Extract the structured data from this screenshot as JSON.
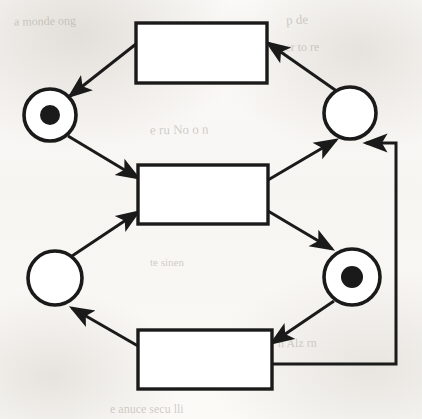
{
  "diagram": {
    "type": "petri-net",
    "canvas": {
      "width": 422,
      "height": 419
    },
    "colors": {
      "stroke": "#1a1a1a",
      "fill": "#ffffff",
      "token": "#1a1a1a",
      "page": "#fbfaf8"
    },
    "places": [
      {
        "id": "p1",
        "name": "place-top-left",
        "cx": 50,
        "cy": 115,
        "r": 26,
        "tokens": 1,
        "token_radius": 10,
        "label": ""
      },
      {
        "id": "p2",
        "name": "place-top-right",
        "cx": 350,
        "cy": 113,
        "r": 26,
        "tokens": 0,
        "token_radius": 10,
        "label": ""
      },
      {
        "id": "p3",
        "name": "place-bottom-left",
        "cx": 55,
        "cy": 278,
        "r": 27,
        "tokens": 0,
        "token_radius": 10,
        "label": ""
      },
      {
        "id": "p4",
        "name": "place-bottom-right",
        "cx": 352,
        "cy": 277,
        "r": 28,
        "tokens": 1,
        "token_radius": 11,
        "label": ""
      }
    ],
    "transitions": [
      {
        "id": "t1",
        "name": "transition-top",
        "x": 136,
        "y": 23,
        "w": 131,
        "h": 60,
        "label": ""
      },
      {
        "id": "t2",
        "name": "transition-middle",
        "x": 138,
        "y": 165,
        "w": 130,
        "h": 59,
        "label": ""
      },
      {
        "id": "t3",
        "name": "transition-bottom",
        "x": 138,
        "y": 330,
        "w": 134,
        "h": 59,
        "label": ""
      }
    ],
    "arcs": [
      {
        "id": "a1",
        "name": "arc-transition-top-to-place-top-left",
        "from": "t1",
        "to": "p1",
        "points": "136,44 70,96",
        "arrow": true
      },
      {
        "id": "a2",
        "name": "arc-place-top-left-to-transition-middle",
        "from": "p1",
        "to": "t2",
        "points": "68,136 138,178",
        "arrow": true
      },
      {
        "id": "a3",
        "name": "arc-place-bottom-left-to-transition-middle",
        "from": "p3",
        "to": "t2",
        "points": "72,256 138,212",
        "arrow": true
      },
      {
        "id": "a4",
        "name": "arc-transition-middle-to-place-top-right",
        "from": "t2",
        "to": "p2",
        "points": "268,180 336,140",
        "arrow": true
      },
      {
        "id": "a5",
        "name": "arc-transition-middle-to-place-bottom-right",
        "from": "t2",
        "to": "p4",
        "points": "268,211 332,249",
        "arrow": true
      },
      {
        "id": "a6",
        "name": "arc-place-top-right-to-transition-top",
        "from": "p2",
        "to": "t1",
        "points": "338,92 268,43",
        "arrow": true
      },
      {
        "id": "a7",
        "name": "arc-place-bottom-right-to-transition-bottom",
        "from": "p4",
        "to": "t3",
        "points": "334,301 272,343",
        "arrow": true
      },
      {
        "id": "a8",
        "name": "arc-transition-bottom-to-place-bottom-left",
        "from": "t3",
        "to": "p3",
        "points": "138,346 72,308",
        "arrow": true
      },
      {
        "id": "a9",
        "name": "arc-transition-bottom-feedback-to-place-top-right",
        "from": "t3",
        "to": "p2",
        "points": "272,364 396,364 396,143 366,143",
        "arrow": true
      }
    ],
    "background_ghost_text": [
      {
        "text": "a monde ong",
        "x": 14,
        "y": 14,
        "size": 12,
        "rotate": -1
      },
      {
        "text": "p de",
        "x": 286,
        "y": 12,
        "size": 13,
        "rotate": -2
      },
      {
        "text": "mger  to  re",
        "x": 270,
        "y": 40,
        "size": 12,
        "rotate": -1
      },
      {
        "text": "a  moine",
        "x": 160,
        "y": 48,
        "size": 11,
        "rotate": 0
      },
      {
        "text": "e  ru  No  o  n",
        "x": 150,
        "y": 122,
        "size": 13,
        "rotate": -1
      },
      {
        "text": "te  sinen",
        "x": 150,
        "y": 256,
        "size": 11,
        "rotate": 0
      },
      {
        "text": "n  Alz  rn",
        "x": 278,
        "y": 336,
        "size": 12,
        "rotate": -1
      },
      {
        "text": "e  anuce  secu  lli",
        "x": 110,
        "y": 402,
        "size": 12,
        "rotate": 0
      }
    ]
  }
}
